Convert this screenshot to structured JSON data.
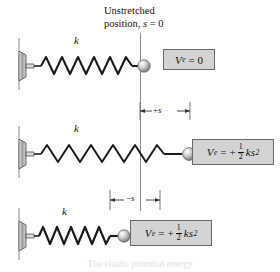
{
  "figure": {
    "title_line1": "Unstretched",
    "title_line2_prefix": "position, ",
    "title_line2_var": "s",
    "title_line2_suffix": " = 0",
    "caption": "The elastic potential energy",
    "datum_color": "#8d8d8d",
    "box_fill": "#d3d3d3",
    "box_border": "#6a6a6a"
  },
  "springs": [
    {
      "state": "unstretched",
      "stiffness_label": "k",
      "coils": 11,
      "length": 118
    },
    {
      "state": "stretched",
      "stiffness_label": "k",
      "coils": 11,
      "length": 155
    },
    {
      "state": "compressed",
      "stiffness_label": "k",
      "coils": 11,
      "length": 92
    }
  ],
  "dimensions": [
    {
      "name": "plus-s",
      "sign": "+",
      "symbol": "s"
    },
    {
      "name": "minus-s",
      "sign": "−",
      "symbol": "s"
    }
  ],
  "equations": [
    {
      "name": "unstretched",
      "var": "V",
      "subscript": "e",
      "relation": "= 0",
      "has_fraction": false,
      "sign": "",
      "numerator": "",
      "denominator": "",
      "term": "",
      "exponent": ""
    },
    {
      "name": "stretched",
      "var": "V",
      "subscript": "e",
      "relation": "=",
      "has_fraction": true,
      "sign": "+",
      "numerator": "1",
      "denominator": "2",
      "term": "ks",
      "exponent": "2"
    },
    {
      "name": "compressed",
      "var": "V",
      "subscript": "e",
      "relation": "=",
      "has_fraction": true,
      "sign": "+",
      "numerator": "1",
      "denominator": "2",
      "term": "ks",
      "exponent": "2"
    }
  ]
}
